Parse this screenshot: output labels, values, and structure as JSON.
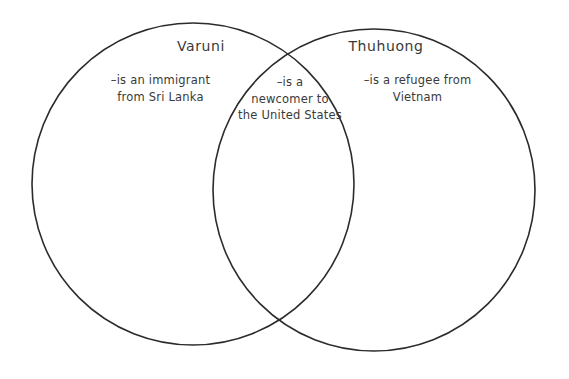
{
  "diagram": {
    "type": "venn",
    "background_color": "#ffffff",
    "stroke_color": "#2b2b2b",
    "text_color": "#3a3a3a",
    "left_set": {
      "title": "Varuni",
      "body": "–is an immigrant\nfrom Sri Lanka"
    },
    "right_set": {
      "title": "Thuhuong",
      "body": "–is a refugee from\nVietnam"
    },
    "intersection": {
      "body": "–is a\nnewcomer to\nthe United States"
    }
  }
}
